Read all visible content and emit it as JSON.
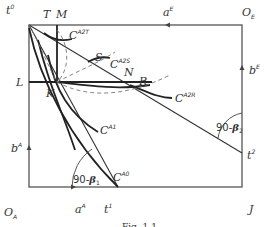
{
  "diagram": {
    "corners": {
      "top_left": "t",
      "top_left_sup": "0",
      "top_right": "O",
      "top_right_sub": "E",
      "bottom_left": "O",
      "bottom_left_sub": "A",
      "bottom_right": "J"
    },
    "axes": {
      "top": {
        "label": "a",
        "sup": "E"
      },
      "right": {
        "label": "b",
        "sup": "E"
      },
      "left": {
        "label": "b",
        "sup": "A"
      },
      "bottom": {
        "label": "a",
        "sup": "A"
      }
    },
    "points": {
      "T": "T",
      "M": "M",
      "L": "L",
      "K": "K",
      "S": "S",
      "N": "N",
      "R": "R",
      "t1": "t",
      "t1_sup": "1",
      "t2": "t",
      "t2_sup": "2"
    },
    "curves": [
      {
        "label": "C",
        "sup": "A2T"
      },
      {
        "label": "C",
        "sup": "A2S"
      },
      {
        "label": "C",
        "sup": "A2R"
      },
      {
        "label": "C",
        "sup": "A1"
      },
      {
        "label": "C",
        "sup": "A0"
      }
    ],
    "angles": [
      {
        "prefix": "90-",
        "symbol": "β",
        "sub": "1"
      },
      {
        "prefix": "90-",
        "symbol": "β",
        "sub": "2"
      }
    ],
    "caption": "Fig. 1.1"
  }
}
